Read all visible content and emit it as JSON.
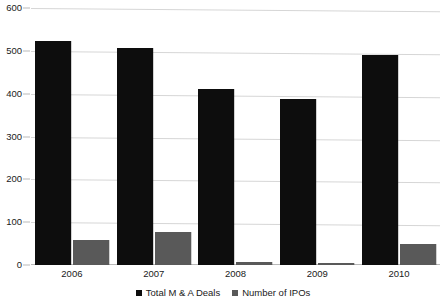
{
  "chart_data": {
    "type": "bar",
    "title": "",
    "subtitle": "",
    "xlabel": "",
    "ylabel": "",
    "categories": [
      "2006",
      "2007",
      "2008",
      "2009",
      "2010"
    ],
    "series": [
      {
        "name": "Total M & A Deals",
        "color": "#0d0d0d",
        "values": [
          523,
          507,
          410,
          388,
          490
        ]
      },
      {
        "name": "Number of IPOs",
        "color": "#595959",
        "values": [
          58,
          76,
          6,
          4,
          50
        ]
      }
    ],
    "ylim": [
      0,
      600
    ],
    "yticks": [
      0,
      100,
      200,
      300,
      400,
      500,
      600
    ],
    "ytick_labels": [
      "0",
      "100",
      "200",
      "300",
      "400",
      "500",
      "600"
    ],
    "grid": true,
    "legend_position": "bottom",
    "legend_entries": [
      "Total M & A Deals",
      "Number of IPOs"
    ]
  },
  "colors": {
    "series_ma": "#0d0d0d",
    "series_ipo": "#595959",
    "gridline": "#d6d6d6",
    "axis": "#b9b9b9",
    "background": "#ffffff",
    "text": "#1a1a1a"
  }
}
